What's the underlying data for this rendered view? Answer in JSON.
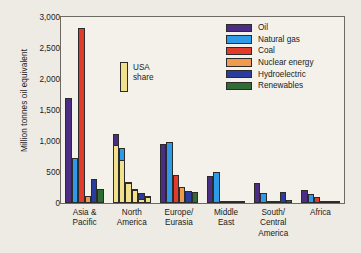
{
  "chart_data": {
    "type": "bar",
    "title": "",
    "xlabel": "",
    "ylabel": "Million tonnes oil equivalent",
    "ylim": [
      0,
      3000
    ],
    "ytick_labels": [
      "3,000",
      "2,500",
      "2,000",
      "1,500",
      "1,000",
      "500",
      "0"
    ],
    "ytick_values": [
      3000,
      2500,
      2000,
      1500,
      1000,
      500,
      0
    ],
    "grid": false,
    "legend_position": "top-right",
    "categories": [
      "Asia &\nPacific",
      "North\nAmerica",
      "Europe/\nEurasia",
      "Middle\nEast",
      "South/\nCentral\nAmerica",
      "Africa"
    ],
    "series": [
      {
        "name": "Oil",
        "color": "#4b2e83",
        "values": [
          1690,
          1120,
          945,
          430,
          330,
          205
        ]
      },
      {
        "name": "Natural gas",
        "color": "#2e9be8",
        "values": [
          720,
          890,
          980,
          495,
          155,
          140
        ]
      },
      {
        "name": "Coal",
        "color": "#e03b2b",
        "values": [
          2830,
          340,
          450,
          10,
          25,
          105
        ]
      },
      {
        "name": "Nuclear energy",
        "color": "#f09a4e",
        "values": [
          120,
          220,
          265,
          0,
          8,
          12
        ]
      },
      {
        "name": "Hydroelectric",
        "color": "#2a3c9e",
        "values": [
          390,
          160,
          195,
          5,
          175,
          30
        ]
      },
      {
        "name": "Renewables",
        "color": "#2e6b35",
        "values": [
          230,
          120,
          175,
          3,
          50,
          8
        ]
      }
    ],
    "overlay": {
      "name": "USA share",
      "color": "#f2e18c",
      "applies_to_category": "North\nAmerica",
      "values": [
        930,
        700,
        315,
        205,
        70,
        100
      ]
    }
  },
  "legend": {
    "items": [
      {
        "label": "Oil",
        "color": "#4b2e83"
      },
      {
        "label": "Natural gas",
        "color": "#2e9be8"
      },
      {
        "label": "Coal",
        "color": "#e03b2b"
      },
      {
        "label": "Nuclear energy",
        "color": "#f09a4e"
      },
      {
        "label": "Hydroelectric",
        "color": "#2a3c9e"
      },
      {
        "label": "Renewables",
        "color": "#2e6b35"
      }
    ]
  },
  "callout": {
    "label": "USA\nshare"
  }
}
